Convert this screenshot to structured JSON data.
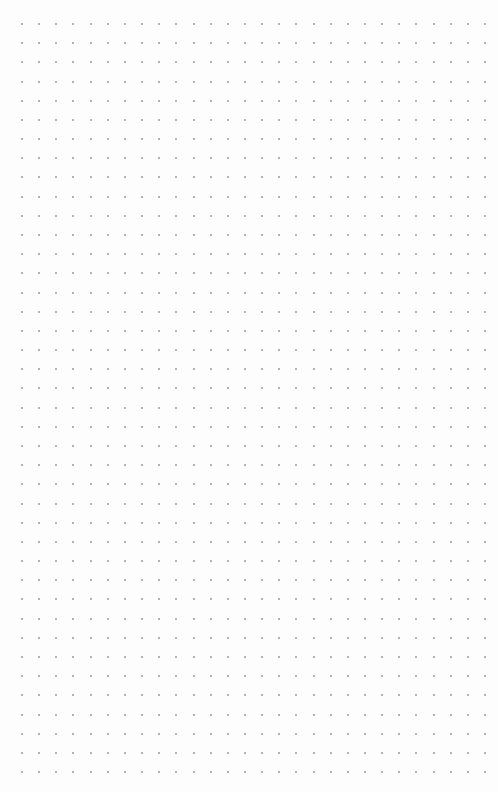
{
  "canvas": {
    "width": 498,
    "height": 792,
    "background": "#fdfdfd"
  },
  "dot_grid": {
    "columns": 28,
    "rows": 40,
    "origin_x": 22,
    "origin_y": 24,
    "pitch_x": 17.15,
    "pitch_y": 19.18,
    "dot_size": 2,
    "dot_color": "#9a9a9a"
  }
}
